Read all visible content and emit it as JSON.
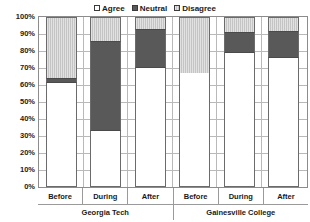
{
  "legend": {
    "position": "top-center",
    "entries": [
      {
        "label": "Agree",
        "swatch": "agree-swatch",
        "color": "#ffffff"
      },
      {
        "label": "Neutral",
        "swatch": "neutral-swatch",
        "color": "#595959"
      },
      {
        "label": "Disagree",
        "swatch": "disagree-swatch",
        "color": "#c4c4c4"
      }
    ]
  },
  "axes": {
    "y_ticks": [
      "100%",
      "90%",
      "80%",
      "70%",
      "60%",
      "50%",
      "40%",
      "30%",
      "20%",
      "10%",
      "0%"
    ],
    "x_categories": [
      "Before",
      "During",
      "After",
      "Before",
      "During",
      "After"
    ],
    "x_groups": [
      "Georgia Tech",
      "Gainesville College"
    ]
  },
  "chart_data": {
    "type": "bar",
    "subtype": "stacked-percentage-column",
    "title": "",
    "subtitle": "",
    "xlabel": "",
    "ylabel": "",
    "ylim": [
      0,
      100
    ],
    "ytick_step": 10,
    "grid": true,
    "legend_position": "top-center",
    "groups": [
      "Georgia Tech",
      "Gainesville College"
    ],
    "categories": [
      "Before",
      "During",
      "After",
      "Before",
      "During",
      "After"
    ],
    "series": [
      {
        "name": "Agree",
        "color": "#ffffff",
        "values": [
          61,
          33,
          70,
          67,
          79,
          76
        ]
      },
      {
        "name": "Neutral",
        "color": "#595959",
        "values": [
          3,
          53,
          23,
          0,
          12,
          16
        ]
      },
      {
        "name": "Disagree",
        "color": "#c4c4c4",
        "values": [
          36,
          14,
          7,
          33,
          9,
          8
        ]
      }
    ],
    "bars": [
      {
        "group": "Georgia Tech",
        "category": "Before",
        "agree": 61,
        "neutral": 3,
        "disagree": 36
      },
      {
        "group": "Georgia Tech",
        "category": "During",
        "agree": 33,
        "neutral": 53,
        "disagree": 14
      },
      {
        "group": "Georgia Tech",
        "category": "After",
        "agree": 70,
        "neutral": 23,
        "disagree": 7
      },
      {
        "group": "Gainesville College",
        "category": "Before",
        "agree": 67,
        "neutral": 0,
        "disagree": 33
      },
      {
        "group": "Gainesville College",
        "category": "During",
        "agree": 79,
        "neutral": 12,
        "disagree": 9
      },
      {
        "group": "Gainesville College",
        "category": "After",
        "agree": 76,
        "neutral": 16,
        "disagree": 8
      }
    ]
  }
}
